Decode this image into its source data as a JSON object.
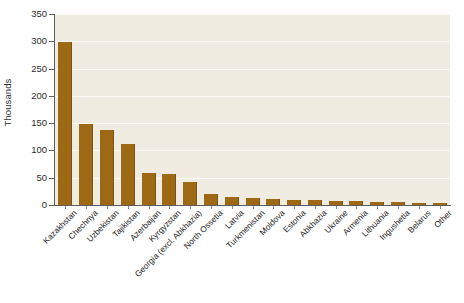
{
  "chart_data": {
    "type": "bar",
    "title": "",
    "subtitle": "",
    "xlabel": "",
    "ylabel": "Thousands",
    "ylim": [
      0,
      350
    ],
    "ytick_values": [
      0,
      50,
      100,
      150,
      200,
      250,
      300,
      350
    ],
    "ytick_labels": [
      "0",
      "50",
      "100",
      "150",
      "200",
      "250",
      "300",
      "350"
    ],
    "grid": true,
    "grid_axis": "y",
    "legend": false,
    "legend_position": "none",
    "bar_color": "#9d6914",
    "plot_background": "#f0ece2",
    "figure_background": "#ffffff",
    "categories": [
      "Kazakhstan",
      "Chechnya",
      "Uzbekistan",
      "Tajikistan",
      "Azerbaijan",
      "Kyrgyzstan",
      "Georgia (excl. Abkhazia)",
      "North Ossetia",
      "Latvia",
      "Turkmenistan",
      "Moldova",
      "Estonia",
      "Abkhazia",
      "Ukraine",
      "Armenia",
      "Lithuania",
      "Ingushetia",
      "Belarus",
      "Other"
    ],
    "values": [
      298,
      148,
      138,
      112,
      58,
      57,
      42,
      20,
      14,
      13,
      11,
      10,
      9,
      8,
      7,
      6,
      5,
      4,
      4
    ],
    "units": "thousands"
  }
}
